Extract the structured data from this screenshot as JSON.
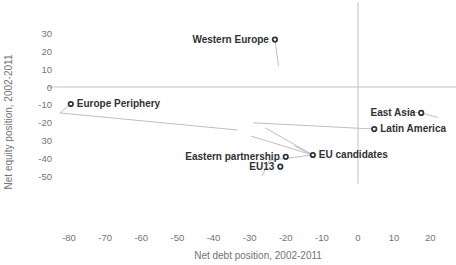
{
  "chart_data": {
    "type": "scatter",
    "title": "",
    "xlabel": "Net debt position, 2002-2011",
    "ylabel": "Net equity position, 2002-2011",
    "xlim": [
      -86,
      24
    ],
    "ylim": [
      -54,
      33
    ],
    "xticks": [
      -80,
      -70,
      -60,
      -50,
      -40,
      -30,
      -20,
      -10,
      0,
      10,
      20
    ],
    "xtick_labels": [
      "-80",
      "-70",
      "-60",
      "-50",
      "-40",
      "-30",
      "-20",
      "-10",
      "0",
      "10",
      "20"
    ],
    "yticks": [
      30,
      20,
      10,
      0,
      -10,
      -20,
      -30,
      -40,
      -50
    ],
    "ytick_labels": [
      "30",
      "20",
      "10",
      "0",
      "-10",
      "-20",
      "30",
      "-40",
      "-50"
    ],
    "grid": false,
    "zero_lines": true,
    "legend": "none",
    "points": [
      {
        "name": "Western Europe",
        "x": -23.0,
        "y": 26.5,
        "label_side": "left"
      },
      {
        "name": "Europe Periphery",
        "x": -79.5,
        "y": -9.5,
        "label_side": "right"
      },
      {
        "name": "East Asia",
        "x": 17.5,
        "y": -14.5,
        "label_side": "left"
      },
      {
        "name": "Latin America",
        "x": 4.5,
        "y": -23.5,
        "label_side": "right"
      },
      {
        "name": "EU candidates",
        "x": -12.5,
        "y": -38.0,
        "label_side": "right"
      },
      {
        "name": "Eastern partnership",
        "x": -20.0,
        "y": -39.0,
        "label_side": "left"
      },
      {
        "name": "EU13",
        "x": -21.5,
        "y": -44.5,
        "label_side": "left"
      }
    ],
    "trajectories": [
      {
        "name": "Western Europe path",
        "points": [
          [
            -23.0,
            26.5
          ],
          [
            -22.0,
            12.0
          ]
        ]
      },
      {
        "name": "Europe Periphery path",
        "points": [
          [
            -79.5,
            -9.5
          ],
          [
            -82.5,
            -14.5
          ],
          [
            -33.5,
            -24.0
          ]
        ]
      },
      {
        "name": "East Asia path",
        "points": [
          [
            12.5,
            -13.5
          ],
          [
            17.5,
            -14.5
          ],
          [
            22.0,
            -17.0
          ]
        ]
      },
      {
        "name": "Latin America path",
        "points": [
          [
            -29.0,
            -20.0
          ],
          [
            4.5,
            -23.5
          ]
        ]
      },
      {
        "name": "EU candidates path",
        "points": [
          [
            -25.5,
            -23.0
          ],
          [
            -12.5,
            -38.0
          ]
        ]
      },
      {
        "name": "EU candidates branch",
        "points": [
          [
            -29.5,
            -27.5
          ],
          [
            -12.5,
            -38.0
          ],
          [
            -17.5,
            -33.0
          ]
        ]
      },
      {
        "name": "EU13 path",
        "points": [
          [
            -12.5,
            -38.0
          ],
          [
            -24.5,
            -41.0
          ],
          [
            -26.5,
            -49.5
          ]
        ]
      }
    ]
  },
  "axis": {
    "x_title": "Net debt position, 2002-2011",
    "y_title": "Net equity position, 2002-2011"
  }
}
